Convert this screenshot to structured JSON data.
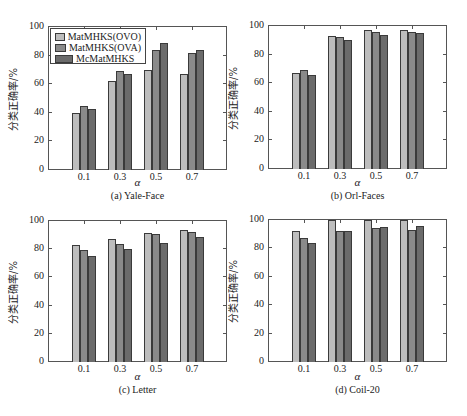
{
  "chart_data": [
    {
      "type": "bar",
      "title": "(a) Yale-Face",
      "xlabel": "α",
      "ylabel": "分类正确率/%",
      "categories": [
        "0.1",
        "0.3",
        "0.5",
        "0.7"
      ],
      "ylim": [
        0,
        100
      ],
      "yticks": [
        "0",
        "20",
        "40",
        "60",
        "80",
        "100"
      ],
      "legend_position": "upper-left",
      "series": [
        {
          "name": "MatMHKS(OVO)",
          "color": "#bdbdbd",
          "values": [
            40,
            62,
            70,
            67
          ]
        },
        {
          "name": "MatMHKS(OVA)",
          "color": "#8a8a8a",
          "values": [
            44.5,
            69,
            84,
            82
          ]
        },
        {
          "name": "McMatMHKS",
          "color": "#6b6b6b",
          "values": [
            43,
            67,
            89,
            84
          ]
        }
      ]
    },
    {
      "type": "bar",
      "title": "(b) Orl-Faces",
      "xlabel": "α",
      "ylabel": "分类正确率/%",
      "categories": [
        "0.1",
        "0.3",
        "0.5",
        "0.7"
      ],
      "ylim": [
        0,
        100
      ],
      "yticks": [
        "0",
        "20",
        "40",
        "60",
        "80",
        "100"
      ],
      "series": [
        {
          "name": "MatMHKS(OVO)",
          "color": "#bdbdbd",
          "values": [
            67,
            93,
            97,
            97
          ]
        },
        {
          "name": "MatMHKS(OVA)",
          "color": "#8a8a8a",
          "values": [
            69.5,
            92,
            96,
            96
          ]
        },
        {
          "name": "McMatMHKS",
          "color": "#6b6b6b",
          "values": [
            66,
            90.5,
            94,
            95
          ]
        }
      ]
    },
    {
      "type": "bar",
      "title": "(c) Letter",
      "xlabel": "α",
      "ylabel": "分类正确率/%",
      "categories": [
        "0.1",
        "0.3",
        "0.5",
        "0.7"
      ],
      "ylim": [
        0,
        100
      ],
      "yticks": [
        "0",
        "20",
        "40",
        "60",
        "80",
        "100"
      ],
      "series": [
        {
          "name": "MatMHKS(OVO)",
          "color": "#bdbdbd",
          "values": [
            83,
            87,
            91.5,
            93.5
          ]
        },
        {
          "name": "MatMHKS(OVA)",
          "color": "#8a8a8a",
          "values": [
            79.5,
            84,
            91,
            92.5
          ]
        },
        {
          "name": "McMatMHKS",
          "color": "#6b6b6b",
          "values": [
            75.5,
            80,
            84.5,
            88.5
          ]
        }
      ]
    },
    {
      "type": "bar",
      "title": "(d) Coil-20",
      "xlabel": "α",
      "ylabel": "分类正确率/%",
      "categories": [
        "0.1",
        "0.3",
        "0.5",
        "0.7"
      ],
      "ylim": [
        0,
        100
      ],
      "yticks": [
        "0",
        "20",
        "40",
        "60",
        "80",
        "100"
      ],
      "series": [
        {
          "name": "MatMHKS(OVO)",
          "color": "#bdbdbd",
          "values": [
            92,
            100,
            100,
            100
          ]
        },
        {
          "name": "MatMHKS(OVA)",
          "color": "#8a8a8a",
          "values": [
            87.5,
            92,
            94.5,
            93
          ]
        },
        {
          "name": "McMatMHKS",
          "color": "#6b6b6b",
          "values": [
            84,
            92,
            95,
            95.5
          ]
        }
      ]
    }
  ],
  "panels": [
    {
      "caption": "(a) Yale-Face",
      "xlabel": "α",
      "ylabel": "分类正确率/%"
    },
    {
      "caption": "(b) Orl-Faces",
      "xlabel": "α",
      "ylabel": "分类正确率/%"
    },
    {
      "caption": "(c) Letter",
      "xlabel": "α",
      "ylabel": "分类正确率/%"
    },
    {
      "caption": "(d) Coil-20",
      "xlabel": "α",
      "ylabel": "分类正确率/%"
    }
  ],
  "legend": {
    "items": [
      {
        "label": "MatMHKS(OVO)",
        "color": "#bdbdbd"
      },
      {
        "label": "MatMHKS(OVA)",
        "color": "#8a8a8a"
      },
      {
        "label": "McMatMHKS",
        "color": "#6b6b6b"
      }
    ]
  }
}
